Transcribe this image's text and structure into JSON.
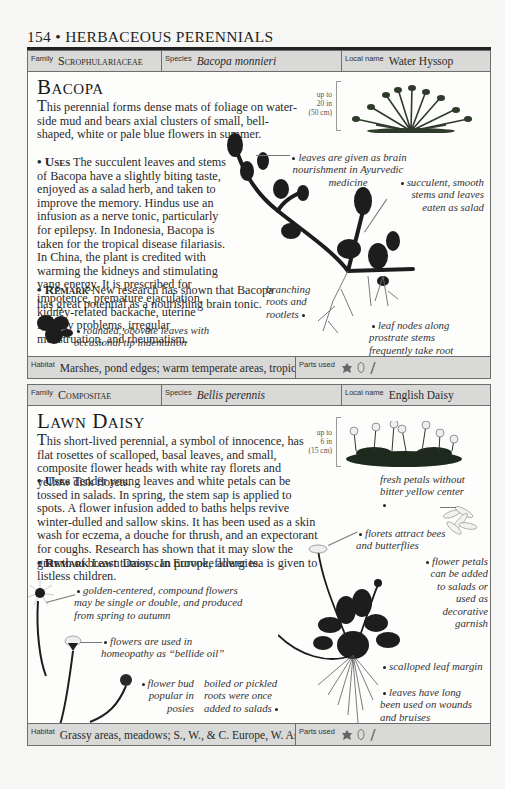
{
  "running_head": "154 • HERBACEOUS PERENNIALS",
  "labels": {
    "family": "Family",
    "species": "Species",
    "local_name": "Local name",
    "habitat": "Habitat",
    "parts_used": "Parts used"
  },
  "entries": [
    {
      "family": "Scrophulariaceae",
      "species": "Bacopa monnieri",
      "local_name": "Water Hyssop",
      "title": "Bacopa",
      "intro": "his perennial forms dense mats of foliage on water-side mud and bears axial clusters of small, bell-shaped, white or pale blue flowers in summer.",
      "intro_initial": "T",
      "uses_label": "Uses",
      "uses": "The succulent leaves and stems of Bacopa have a slightly biting taste, enjoyed as a salad herb, and taken to improve the memory. Hindus use an infusion as a nerve tonic, particularly for epilepsy. In Indonesia, Bacopa is taken for the tropical disease filariasis. In China, the plant is credited with warming the kidneys and stimulating yang energy. It is prescribed for impotence, premature ejaculation, kidney-related backache, uterine fertility problems, irregular menstruation, and rheumatism.",
      "remark_label": "Remark",
      "remark": "New research has shown that Bacopa has great potential as a nourishing brain tonic.",
      "scale": [
        "up to",
        "20 in",
        "(50 cm)"
      ],
      "annotations": [
        "leaves are given as brain nourishment in Ayurvedic medicine",
        "succulent, smooth stems and leaves eaten as salad",
        "branching roots and rootlets",
        "leaf nodes along prostrate stems frequently take root",
        "rounded, obovate leaves with occasional tip indentation"
      ],
      "habitat": "Marshes, pond edges; warm temperate areas, tropics",
      "parts_used_icons": [
        "leaf-icon",
        "flower-icon",
        "stem-icon"
      ]
    },
    {
      "family": "Compositae",
      "species": "Bellis perennis",
      "local_name": "English Daisy",
      "title": "Lawn Daisy",
      "intro": "his short-lived perennial, a symbol of innocence, has flat rosettes of scalloped, basal leaves, and small, composite flower heads with white ray florets and yellow disk florets.",
      "intro_initial": "T",
      "uses_label": "Uses",
      "uses": "Tender young leaves and white petals can be tossed in salads. In spring, the stem sap is applied to spots. A flower infusion added to baths helps revive winter-dulled and sallow skins. It has been used as a skin wash for eczema, a douche for thrush, and an expectorant for coughs. Research has shown that it may slow the growth of breast tumors. In Europe, flower tea is given to listless children.",
      "remark_label": "Remark",
      "remark": "Lawn Daisy can provoke allergies.",
      "scale": [
        "up to",
        "6 in",
        "(15 cm)"
      ],
      "annotations": [
        "fresh petals without bitter yellow center",
        "florets attract bees and butterflies",
        "flower petals can be added to salads or used as decorative garnish",
        "golden-centered, compound flowers may be single or double, and produced from spring to autumn",
        "flowers are used in homeopathy as “bellide oil”",
        "scalloped leaf margin",
        "leaves have long been used on wounds and bruises",
        "flower bud popular in posies",
        "boiled or pickled roots were once added to salads"
      ],
      "habitat": "Grassy areas, meadows; S., W., & C. Europe, W. Asia",
      "parts_used_icons": [
        "leaf-icon",
        "flower-icon",
        "stem-icon"
      ]
    }
  ]
}
